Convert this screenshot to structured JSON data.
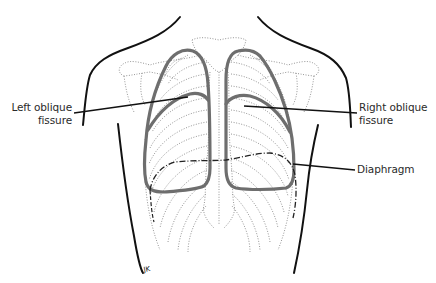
{
  "diagram": {
    "colors": {
      "background": "#ffffff",
      "body_outline": "#111111",
      "lung_outline": "#6e6e6e",
      "skeleton_dotted": "#8a8a8a",
      "leader_line": "#111111",
      "diaphragm": "#222222",
      "label_text": "#2a2a2a"
    },
    "labels": {
      "left_oblique_fissure": {
        "line1": "Left oblique",
        "line2": "fissure"
      },
      "right_oblique_fissure": {
        "line1": "Right oblique",
        "line2": "fissure"
      },
      "diaphragm": "Diaphragm"
    },
    "signature_mark": "JK"
  }
}
